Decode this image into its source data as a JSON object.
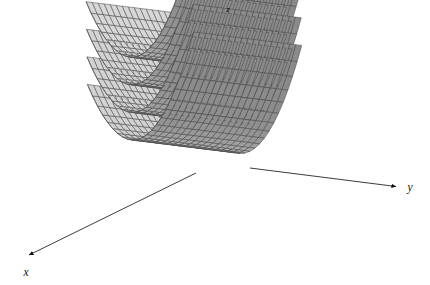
{
  "figure": {
    "kind": "3d-surface-plot",
    "background": "#ffffff",
    "width": 430,
    "height": 285
  },
  "axes": {
    "x": {
      "label": "x",
      "arrow_tip": [
        26,
        257
      ],
      "origin": [
        196,
        147
      ],
      "name": "x-axis"
    },
    "y": {
      "label": "y",
      "arrow_tip": [
        398,
        187
      ],
      "origin": [
        196,
        147
      ],
      "name": "y-axis"
    },
    "z": {
      "label": "z",
      "arrow_tip": [
        218,
        11
      ],
      "origin": [
        220,
        60
      ],
      "name": "z-axis"
    }
  },
  "style": {
    "surface_light": "#c9c9c9",
    "surface_mid": "#b4b4b4",
    "surface_dark": "#9a9a9a",
    "surface_darkest": "#8c8c8c",
    "mesh_line": "#4a4a4a",
    "axis_line": "#1a1a1a",
    "edge_line": "#555555",
    "mesh_line_width": 0.55,
    "axis_line_width": 0.9
  },
  "chart_data": {
    "type": "surface",
    "title": "",
    "xlabel": "x",
    "ylabel": "y",
    "zlabel": "z",
    "surface_count": 4,
    "surfaces": [
      {
        "name": "sheet-1",
        "c": 3,
        "z_offset": 0,
        "shade_left": "#9a9a9a",
        "shade_right": "#c9c9c9"
      },
      {
        "name": "sheet-2",
        "c": 2,
        "z_offset": 46,
        "shade_left": "#9a9a9a",
        "shade_right": "#c9c9c9"
      },
      {
        "name": "sheet-3",
        "c": 1,
        "z_offset": 92,
        "shade_left": "#9a9a9a",
        "shade_right": "#c9c9c9"
      },
      {
        "name": "sheet-4",
        "c": 0,
        "z_offset": 138,
        "shade_left": "#9a9a9a",
        "shade_right": "#c9c9c9"
      }
    ],
    "mesh": {
      "u_divisions": 22,
      "v_divisions": 18,
      "grid": true
    },
    "axis_ranges": {
      "x": [
        -2,
        2
      ],
      "y": [
        -2,
        2
      ],
      "z": [
        0,
        4
      ]
    },
    "legend": {
      "visible": false,
      "position": "none"
    },
    "grid": true
  }
}
